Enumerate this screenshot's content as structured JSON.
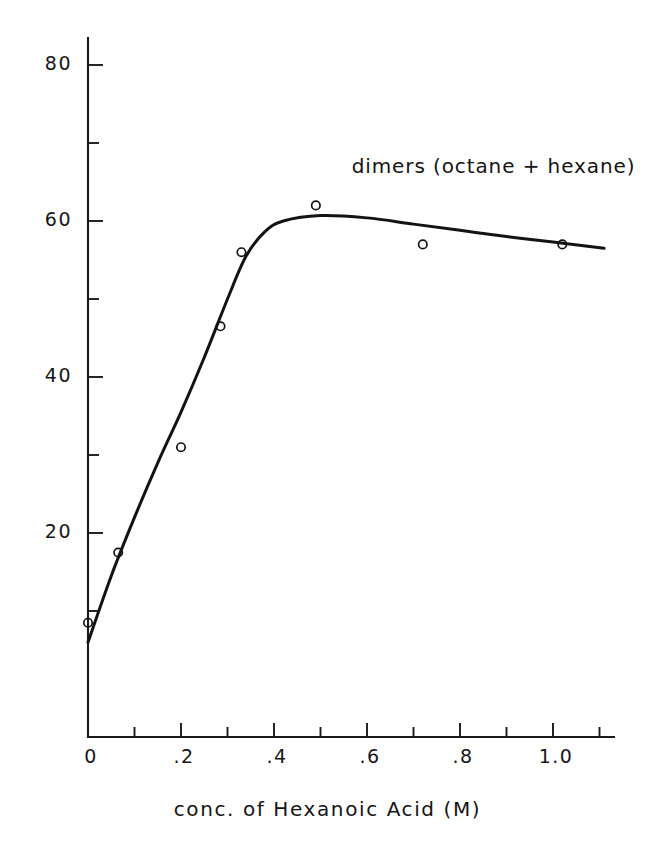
{
  "chart_data": {
    "type": "line",
    "title": "",
    "xlabel": "conc. of Hexanoic Acid (M)",
    "ylabel": "",
    "xlim": [
      0,
      1.1
    ],
    "ylim": [
      0,
      84
    ],
    "grid": false,
    "legend": "none",
    "annotations": [
      {
        "text": "dimers (octane + hexane)",
        "x": 0.61,
        "y": 67
      }
    ],
    "xticks": [
      0,
      0.2,
      0.4,
      0.6,
      0.8,
      1.0
    ],
    "xtick_labels": [
      "0",
      ".2",
      ".4",
      ".6",
      ".8",
      "1.0"
    ],
    "xminor_ticks": [
      0.1,
      0.3,
      0.5,
      0.7,
      0.9,
      1.1
    ],
    "yticks": [
      20,
      40,
      60,
      80
    ],
    "ytick_labels": [
      "20",
      "40",
      "60",
      "80"
    ],
    "yminor_ticks": [
      10,
      30,
      50,
      70
    ],
    "series": [
      {
        "name": "dimers (octane + hexane)",
        "marker": "open-circle",
        "x": [
          0.0,
          0.065,
          0.2,
          0.285,
          0.33,
          0.49,
          0.72,
          1.02
        ],
        "values": [
          8.5,
          17.5,
          31.0,
          46.5,
          56.0,
          62.0,
          57.0,
          57.0
        ]
      }
    ],
    "curve_points": [
      {
        "x": 0.0,
        "y": 6.0
      },
      {
        "x": 0.05,
        "y": 14.5
      },
      {
        "x": 0.1,
        "y": 22.0
      },
      {
        "x": 0.15,
        "y": 29.0
      },
      {
        "x": 0.2,
        "y": 35.5
      },
      {
        "x": 0.25,
        "y": 42.5
      },
      {
        "x": 0.3,
        "y": 50.0
      },
      {
        "x": 0.34,
        "y": 55.5
      },
      {
        "x": 0.38,
        "y": 58.6
      },
      {
        "x": 0.42,
        "y": 60.0
      },
      {
        "x": 0.5,
        "y": 60.7
      },
      {
        "x": 0.6,
        "y": 60.4
      },
      {
        "x": 0.7,
        "y": 59.6
      },
      {
        "x": 0.8,
        "y": 58.8
      },
      {
        "x": 0.9,
        "y": 58.0
      },
      {
        "x": 1.0,
        "y": 57.3
      },
      {
        "x": 1.11,
        "y": 56.5
      }
    ]
  }
}
